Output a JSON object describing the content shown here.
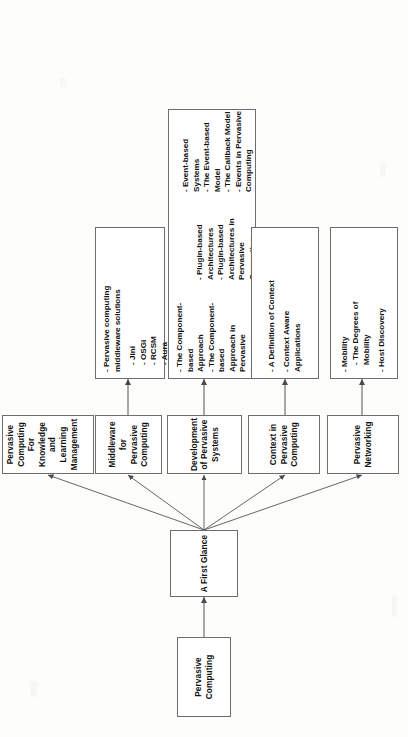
{
  "diagram": {
    "orientation": "rotated-90-ccw",
    "root": {
      "label": "Pervasive Computing"
    },
    "hub": {
      "label": "A First Glance"
    },
    "branches": [
      {
        "label": "Pervasive Networking"
      },
      {
        "label": "Context in Pervasive Computing"
      },
      {
        "label": "Development of Pervasive Systems"
      },
      {
        "label": "Middleware for Pervasive Computing"
      },
      {
        "label": "Pervasive Computing For Knowledge and Learning Management"
      }
    ],
    "details": {
      "networking": {
        "groups": [
          {
            "items": [
              "- Mobility",
              "- The Degrees of\nMobility"
            ]
          },
          {
            "items": [
              "- Host Discovery"
            ]
          }
        ]
      },
      "context": {
        "groups": [
          {
            "items": [
              "- A Definition of Context"
            ]
          },
          {
            "items": [
              "- Context Aware\nApplications"
            ]
          }
        ]
      },
      "development": {
        "columns": [
          {
            "groups": [
              {
                "items": [
                  "- The Component-based\nApproach",
                  "- The Component-based\nApproach in Pervasive\nComputing"
                ]
              }
            ]
          },
          {
            "groups": [
              {
                "items": [
                  "- Plugin-based\nArchitectures",
                  "- Plugin-based\nArchitectures in\nPervasive Computing"
                ]
              }
            ]
          },
          {
            "groups": [
              {
                "items": [
                  "- Event-based Systems",
                  "- The Event-based\nModel",
                  "- The Callback Model",
                  "- Events in Pervasive\nComputing"
                ]
              }
            ]
          }
        ]
      },
      "middleware": {
        "groups": [
          {
            "items": [
              "- Pervasive computing\nmiddleware solutions"
            ]
          },
          {
            "items": [
              "- Jini",
              "- OSGi",
              "- RCSM",
              "- Aura",
              "- SOCAM"
            ]
          }
        ]
      }
    },
    "colors": {
      "box_border": "#6d6d6d",
      "box_fill": "#ffffff",
      "connector": "#555555",
      "text": "#111111",
      "page_background": "#fdfdfc"
    }
  }
}
